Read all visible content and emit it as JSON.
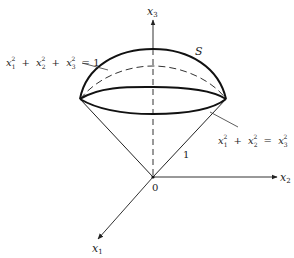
{
  "figure": {
    "axes": {
      "x1": {
        "name": "x",
        "sub": "1"
      },
      "x2": {
        "name": "x",
        "sub": "2"
      },
      "x3": {
        "name": "x",
        "sub": "3"
      }
    },
    "origin_label": "0",
    "surface_label": "S",
    "slant_length_label": "1",
    "sphere_equation": {
      "terms": [
        {
          "var": "x",
          "sub": "1",
          "sup": "2"
        },
        {
          "var": "x",
          "sub": "2",
          "sup": "2"
        },
        {
          "var": "x",
          "sub": "3",
          "sup": "2"
        }
      ],
      "op": "+",
      "rhs": "= 1"
    },
    "cone_equation": {
      "terms": [
        {
          "var": "x",
          "sub": "1",
          "sup": "2"
        },
        {
          "var": "x",
          "sub": "2",
          "sup": "2"
        }
      ],
      "op": "+",
      "rhs_var": "x",
      "rhs_sub": "3",
      "rhs_sup": "2"
    },
    "colors": {
      "line": "#111111",
      "axis": "#333333",
      "text": "#222222"
    }
  }
}
